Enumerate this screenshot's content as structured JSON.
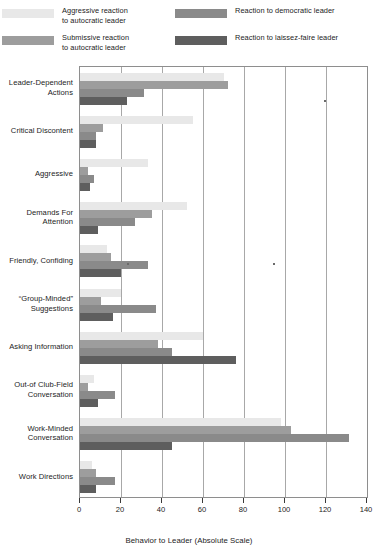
{
  "legend": {
    "items": [
      {
        "label": "Aggressive reaction\nto autocratic leader",
        "color": "#e8e8e8",
        "position": "left-top"
      },
      {
        "label": "Submissive reaction\nto autocratic leader",
        "color": "#9d9d9d",
        "position": "left-bottom"
      },
      {
        "label": "Reaction to democratic leader",
        "color": "#8a8a8a",
        "position": "right-top"
      },
      {
        "label": "Reaction to laissez-faire leader",
        "color": "#5e5e5e",
        "position": "right-bottom"
      }
    ]
  },
  "chart_data": {
    "type": "bar",
    "orientation": "horizontal",
    "title": "",
    "xlabel": "Behavior to Leader (Absolute Scale)",
    "ylabel": "",
    "xlim": [
      0,
      140
    ],
    "xticks": [
      0,
      20,
      40,
      60,
      80,
      100,
      120,
      140
    ],
    "xtick_labels": [
      "0",
      "20",
      "40",
      "60",
      "80",
      "100",
      "120",
      "140"
    ],
    "grid": "vertical",
    "legend_position": "top",
    "categories": [
      "Leader-Dependent\nActions",
      "Critical Discontent",
      "Aggressive",
      "Demands For\nAttention",
      "Friendly, Confiding",
      "“Group-Minded”\nSuggestions",
      "Asking Information",
      "Out-of Club-Field\nConversation",
      "Work-Minded\nConversation",
      "Work Directions"
    ],
    "series": [
      {
        "name": "Aggressive reaction to autocratic leader",
        "color": "#e8e8e8",
        "values": [
          70,
          55,
          33,
          52,
          13,
          20,
          60,
          7,
          98,
          6
        ]
      },
      {
        "name": "Submissive reaction to autocratic leader",
        "color": "#9d9d9d",
        "values": [
          72,
          11,
          4,
          35,
          15,
          10,
          38,
          4,
          103,
          8
        ]
      },
      {
        "name": "Reaction to democratic leader",
        "color": "#8a8a8a",
        "values": [
          31,
          8,
          7,
          27,
          33,
          37,
          45,
          17,
          131,
          17
        ]
      },
      {
        "name": "Reaction to laissez-faire leader",
        "color": "#5e5e5e",
        "values": [
          23,
          8,
          5,
          9,
          20,
          16,
          76,
          9,
          45,
          8
        ]
      }
    ]
  },
  "axis": {
    "x_title": "Behavior to Leader (Absolute Scale)"
  }
}
